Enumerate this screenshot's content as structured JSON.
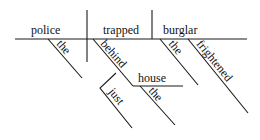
{
  "diagram": {
    "type": "Reed-Kellogg sentence diagram",
    "sentence_words": {
      "subject": "police",
      "verb": "trapped",
      "object": "burglar",
      "subject_modifier": "the",
      "preposition": "behind",
      "prep_object": "house",
      "prep_modifier": "just",
      "prep_object_modifier": "the",
      "object_modifier_article": "the",
      "object_modifier_adj": "frightened"
    },
    "line_color": "#1a1a1a",
    "text_color": "#111111"
  }
}
